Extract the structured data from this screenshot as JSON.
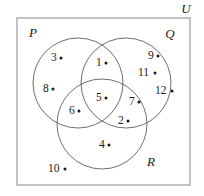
{
  "diagram": {
    "type": "venn-3-set",
    "title_label": "U",
    "universe": {
      "name": "U",
      "label": "U",
      "label_x": 186,
      "label_y": 13,
      "rect": {
        "x": 17,
        "y": 18,
        "width": 173,
        "height": 167
      },
      "border_color": "#b4b4b4"
    },
    "sets": [
      {
        "id": "P",
        "label": "P",
        "cx": 78,
        "cy": 83,
        "r": 45,
        "label_x": 33,
        "label_y": 37,
        "stroke": "#4a4a4a"
      },
      {
        "id": "Q",
        "label": "Q",
        "cx": 126,
        "cy": 83,
        "r": 45,
        "label_x": 170,
        "label_y": 38,
        "stroke": "#4a4a4a"
      },
      {
        "id": "R",
        "label": "R",
        "cx": 102,
        "cy": 124,
        "r": 45,
        "label_x": 151,
        "label_y": 166,
        "stroke": "#4a4a4a"
      }
    ],
    "elements": [
      {
        "label": "3",
        "region": "P-only",
        "text_x": 51,
        "text_y": 61,
        "dot_x": 61,
        "dot_y": 58
      },
      {
        "label": "8",
        "region": "P-only",
        "text_x": 43,
        "text_y": 92,
        "dot_x": 53,
        "dot_y": 89
      },
      {
        "label": "1",
        "region": "P-and-Q",
        "text_x": 96,
        "text_y": 66,
        "dot_x": 106,
        "dot_y": 63
      },
      {
        "label": "9",
        "region": "Q-only",
        "text_x": 148,
        "text_y": 59,
        "dot_x": 158,
        "dot_y": 56
      },
      {
        "label": "11",
        "region": "Q-only",
        "text_x": 138,
        "text_y": 76,
        "dot_x": 155,
        "dot_y": 73
      },
      {
        "label": "12",
        "region": "Q-only",
        "text_x": 155,
        "text_y": 94,
        "dot_x": 172,
        "dot_y": 91
      },
      {
        "label": "5",
        "region": "P-Q-R",
        "text_x": 96,
        "text_y": 101,
        "dot_x": 106,
        "dot_y": 98
      },
      {
        "label": "6",
        "region": "P-and-R",
        "text_x": 69,
        "text_y": 114,
        "dot_x": 79,
        "dot_y": 111
      },
      {
        "label": "7",
        "region": "Q-and-R",
        "text_x": 129,
        "text_y": 105,
        "dot_x": 139,
        "dot_y": 102
      },
      {
        "label": "2",
        "region": "Q-and-R",
        "text_x": 118,
        "text_y": 124,
        "dot_x": 128,
        "dot_y": 121
      },
      {
        "label": "4",
        "region": "R-only",
        "text_x": 99,
        "text_y": 148,
        "dot_x": 109,
        "dot_y": 145
      },
      {
        "label": "10",
        "region": "R-only",
        "text_x": 48,
        "text_y": 172,
        "dot_x": 65,
        "dot_y": 169
      }
    ]
  }
}
